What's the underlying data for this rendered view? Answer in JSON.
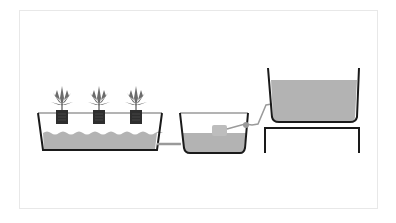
{
  "diagram": {
    "title": "",
    "components": [
      {
        "id": "grow-tray",
        "label": "",
        "plants": 3
      },
      {
        "id": "control-bucket",
        "label": ""
      },
      {
        "id": "reservoir",
        "label": ""
      },
      {
        "id": "stand",
        "label": ""
      }
    ],
    "colors": {
      "outline": "#1a1a1a",
      "water": "#b3b3b3",
      "pipe": "#9a9a9a",
      "plant": "#6b6b6b",
      "pot": "#2e2e2e",
      "float": "#bdbdbd",
      "frame_border": "#e8e8e8"
    }
  }
}
